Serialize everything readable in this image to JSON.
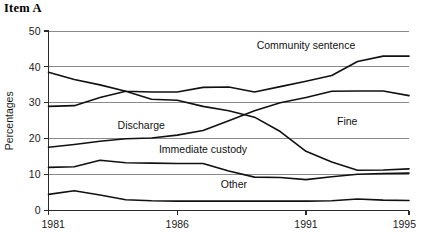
{
  "figure": {
    "title": "Item A",
    "ylabel": "Percentages",
    "xlabel": ""
  },
  "axis": {
    "y_ticks": [
      "0",
      "10",
      "20",
      "30",
      "40",
      "50"
    ],
    "x_ticks": [
      "1981",
      "1986",
      "1991",
      "1995"
    ]
  },
  "labels": {
    "community_sentence": "Community sentence",
    "fine": "Fine",
    "discharge": "Discharge",
    "immediate_custody": "Immediate custody",
    "other": "Other"
  },
  "chart_data": {
    "type": "line",
    "title": "Item A",
    "xlabel": "",
    "ylabel": "Percentages",
    "xlim": [
      1981,
      1995
    ],
    "ylim": [
      0,
      50
    ],
    "yticks": [
      0,
      10,
      20,
      30,
      40,
      50
    ],
    "xticks": [
      1981,
      1986,
      1991,
      1995
    ],
    "grid": true,
    "legend": "inline-annotations",
    "x": [
      1981,
      1982,
      1983,
      1984,
      1985,
      1986,
      1987,
      1988,
      1989,
      1990,
      1991,
      1992,
      1993,
      1994,
      1995
    ],
    "series": [
      {
        "name": "Fine",
        "label_position": "inline",
        "values": [
          38.5,
          36.5,
          35.0,
          33.2,
          33.0,
          33.0,
          34.3,
          34.4,
          33.0,
          34.5,
          36.0,
          37.6,
          41.5,
          43.0,
          43.0
        ]
      },
      {
        "name": "Community sentence",
        "label_position": "inline",
        "values": [
          29.0,
          29.2,
          31.5,
          33.2,
          31.0,
          30.7,
          29.0,
          27.8,
          26.0,
          22.0,
          16.5,
          13.5,
          11.2,
          11.3,
          11.6
        ]
      },
      {
        "name": "Discharge",
        "label_position": "inline",
        "values": [
          17.6,
          18.4,
          19.3,
          20.0,
          20.2,
          21.0,
          22.3,
          25.0,
          27.8,
          30.0,
          31.5,
          33.2,
          33.3,
          33.3,
          32.0
        ]
      },
      {
        "name": "Immediate custody",
        "label_position": "inline",
        "values": [
          12.0,
          12.2,
          14.0,
          13.3,
          13.2,
          13.1,
          13.1,
          11.0,
          9.3,
          9.2,
          8.6,
          9.4,
          10.1,
          10.3,
          10.4
        ]
      },
      {
        "name": "Other",
        "label_position": "inline",
        "values": [
          4.5,
          5.5,
          4.3,
          3.0,
          2.7,
          2.6,
          2.6,
          2.6,
          2.6,
          2.6,
          2.6,
          2.7,
          3.2,
          2.9,
          2.8
        ]
      }
    ],
    "annotations": [
      {
        "text": "Community sentence",
        "x": 1991.0,
        "y": 45.0
      },
      {
        "text": "Fine",
        "x": 1992.6,
        "y": 23.8
      },
      {
        "text": "Discharge",
        "x": 1984.6,
        "y": 22.8
      },
      {
        "text": "Immediate custody",
        "x": 1987.0,
        "y": 16.0
      },
      {
        "text": "Other",
        "x": 1988.2,
        "y": 6.2
      }
    ]
  }
}
